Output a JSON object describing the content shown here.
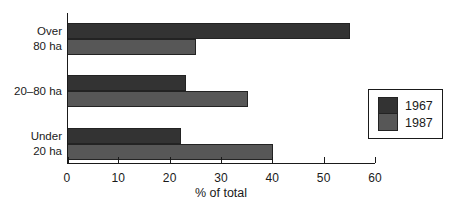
{
  "figure": {
    "background": "#ffffff",
    "axis_color": "#1a1a1a"
  },
  "chart_data": {
    "type": "bar",
    "orientation": "horizontal",
    "title": "",
    "categories": [
      "Over 80 ha",
      "20–80 ha",
      "Under 20 ha"
    ],
    "category_label_lines": [
      [
        "Over",
        "80 ha"
      ],
      [
        "20–80 ha"
      ],
      [
        "Under",
        "20 ha"
      ]
    ],
    "series": [
      {
        "name": "1967",
        "color": "#333333",
        "values": [
          55,
          23,
          22
        ]
      },
      {
        "name": "1987",
        "color": "#575757",
        "values": [
          25,
          35,
          40
        ]
      }
    ],
    "xlabel": "% of total",
    "xlim": [
      0,
      60
    ],
    "xticks": [
      0,
      10,
      20,
      30,
      40,
      50,
      60
    ],
    "grid": false,
    "legend": {
      "position": "right",
      "entries": [
        "1967",
        "1987"
      ]
    }
  }
}
